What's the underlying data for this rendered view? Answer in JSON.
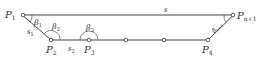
{
  "diagram": {
    "line_color": "#444444",
    "points": [
      {
        "id": "P1",
        "label": "P",
        "sub": "1",
        "x": 23,
        "y": 15
      },
      {
        "id": "P2",
        "label": "P",
        "sub": "2",
        "x": 51,
        "y": 40
      },
      {
        "id": "P3",
        "label": "P",
        "sub": "3",
        "x": 89,
        "y": 40
      },
      {
        "id": "Pa",
        "label": "",
        "sub": "",
        "x": 126,
        "y": 40
      },
      {
        "id": "Pb",
        "label": "",
        "sub": "",
        "x": 164,
        "y": 40
      },
      {
        "id": "P4",
        "label": "P",
        "sub": "4",
        "x": 208,
        "y": 40
      },
      {
        "id": "Pn1",
        "label": "P",
        "sub": "n+1",
        "x": 233,
        "y": 15
      }
    ],
    "segment_labels": {
      "s": "s",
      "s1": {
        "main": "s",
        "sub": "1"
      },
      "s2": {
        "main": "s",
        "sub": "2"
      }
    },
    "angle_labels": {
      "beta1": {
        "main": "β",
        "sub": "1"
      },
      "beta2": {
        "main": "β",
        "sub": "2"
      },
      "beta3": {
        "main": "β",
        "sub": "3"
      },
      "betan1": {
        "main": "β",
        "sub": "n+1"
      }
    }
  }
}
